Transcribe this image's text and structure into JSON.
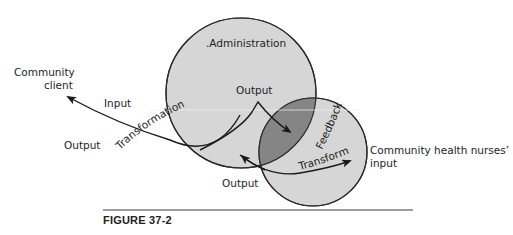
{
  "diagram": {
    "circles": [
      {
        "name": "Administration",
        "cx": 241,
        "cy": 93,
        "r": 75,
        "fill": "#d6d6d6"
      },
      {
        "name": "Community health nurses",
        "cx": 313,
        "cy": 152,
        "r": 54,
        "fill": "#d6d6d6"
      }
    ],
    "overlap_fill": "#858585",
    "stroke_color": "#2a2a2a",
    "labels": {
      "administration": ".Administration",
      "community_client_line1": "Community",
      "community_client_line2": "client",
      "input": "Input",
      "output_left": "Output",
      "output_top": "Output",
      "output_bottom": "Output",
      "transformation_left": "Transformation",
      "feedback": "Feedback",
      "transformation_right": "Transformation",
      "nurses_line1": "Community health nurses’",
      "nurses_line2": "input"
    }
  },
  "caption": {
    "figure_label": "FIGURE 37-2"
  }
}
